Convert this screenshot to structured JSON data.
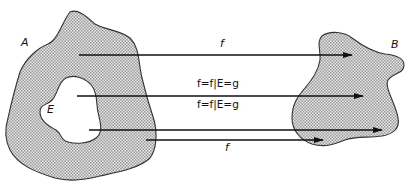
{
  "diagram": {
    "sets": [
      {
        "id": "A",
        "label": "A"
      },
      {
        "id": "B",
        "label": "B"
      },
      {
        "id": "E",
        "label": "E"
      }
    ],
    "arrows": [
      {
        "label": "f",
        "from": "A",
        "to": "B"
      },
      {
        "label": "f=f|E=g",
        "from": "E",
        "to": "B"
      },
      {
        "label": "f=f|E=g",
        "from": "E",
        "to": "B"
      },
      {
        "label": "f",
        "from": "A",
        "to": "B"
      }
    ],
    "colors": {
      "fill": "#cfcfcf",
      "stroke": "#333333",
      "arrow": "#111111",
      "background": "#ffffff"
    }
  }
}
